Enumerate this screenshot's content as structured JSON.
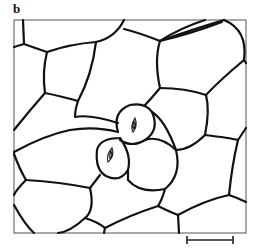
{
  "figure": {
    "panel_label": "b",
    "scale_bar": {
      "x1": 187,
      "x2": 233,
      "y": 240,
      "label": ""
    },
    "colors": {
      "line": "#111111",
      "frame": "#555555",
      "background": "#ffffff"
    }
  }
}
